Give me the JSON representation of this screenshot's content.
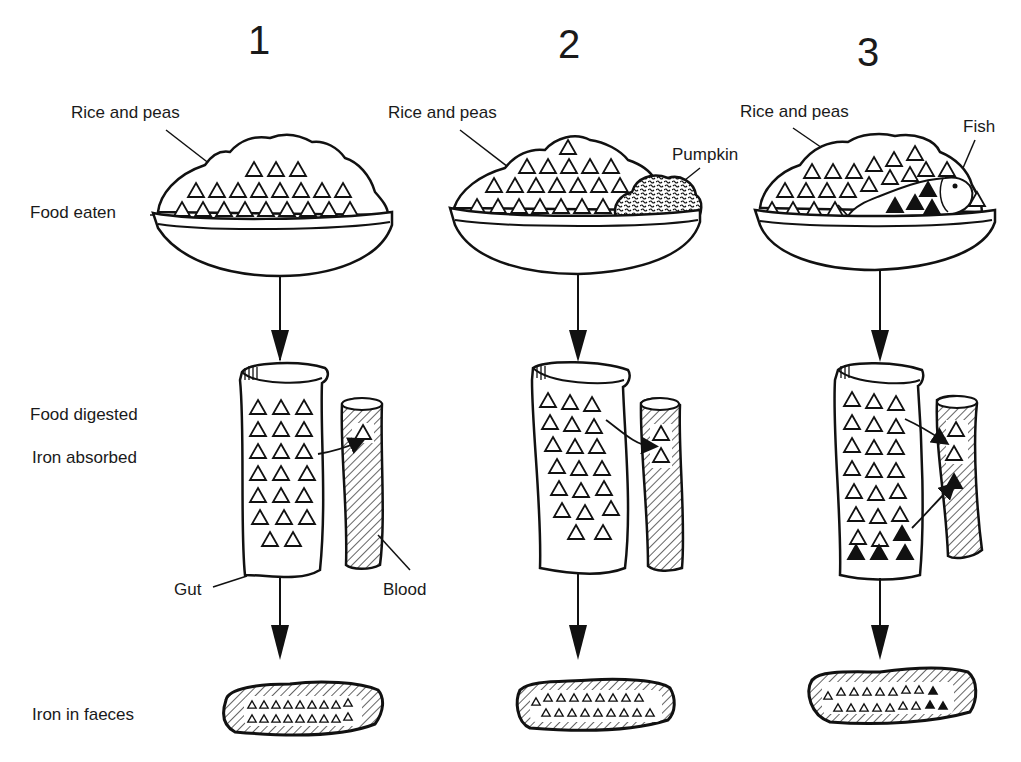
{
  "diagram": {
    "panels": [
      {
        "number": "1",
        "food_labels": [
          "Rice and peas"
        ],
        "iron_in_food": "non-haem (open triangles)",
        "absorbed": 1
      },
      {
        "number": "2",
        "food_labels": [
          "Rice and peas",
          "Pumpkin"
        ],
        "iron_in_food": "non-haem (open triangles)",
        "absorbed": 2
      },
      {
        "number": "3",
        "food_labels": [
          "Rice and peas",
          "Fish"
        ],
        "iron_in_food": "non-haem (open) + haem (filled triangles)",
        "absorbed": 3
      }
    ],
    "row_labels": {
      "food_eaten": "Food eaten",
      "food_digested": "Food digested",
      "iron_absorbed": "Iron absorbed",
      "iron_in_faeces": "Iron in faeces"
    },
    "part_labels": {
      "gut": "Gut",
      "blood": "Blood"
    },
    "legend_symbols": {
      "open_triangle": "non-haem iron",
      "filled_triangle": "haem iron"
    },
    "colors": {
      "ink": "#111111",
      "background": "#ffffff"
    }
  }
}
